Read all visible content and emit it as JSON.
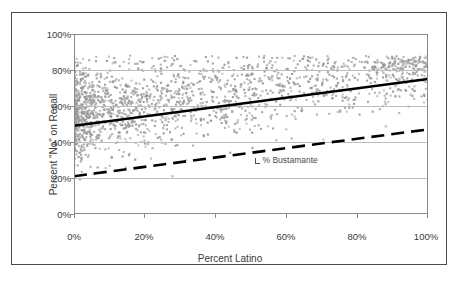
{
  "chart_data": {
    "type": "scatter",
    "title": "",
    "xlabel": "Percent Latino",
    "ylabel": "Percent \"No\" on Recall",
    "xlim": [
      0,
      100
    ],
    "ylim": [
      0,
      100
    ],
    "x_ticks": [
      "0%",
      "20%",
      "40%",
      "60%",
      "80%",
      "100%"
    ],
    "x_tick_values": [
      0,
      20,
      40,
      60,
      80,
      100
    ],
    "y_ticks": [
      "0%",
      "20%",
      "40%",
      "60%",
      "80%",
      "100%"
    ],
    "y_tick_values": [
      0,
      20,
      40,
      60,
      80,
      100
    ],
    "grid": "horizontal",
    "legend": "none",
    "point_color": "#9a9a9a",
    "line_color": "#000000",
    "annotations": [
      {
        "text": "% Bustamante",
        "x": 51,
        "y": 30,
        "marker": "leader-tick"
      }
    ],
    "series": [
      {
        "name": "Precincts",
        "type": "scatter",
        "marker": "diamond",
        "color": "#9a9a9a",
        "n": 1800,
        "description": "Precinct-level scatter of percent 'No' on recall versus percent Latino; dense cluster at low percent Latino with values mostly between 40% and 85%."
      },
      {
        "name": "No on Recall trend",
        "type": "line",
        "style": "solid",
        "color": "#000000",
        "x": [
          0,
          100
        ],
        "values": [
          49,
          75
        ]
      },
      {
        "name": "% Bustamante trend",
        "type": "line",
        "style": "dashed",
        "color": "#000000",
        "x": [
          0,
          100
        ],
        "values": [
          21,
          47
        ]
      }
    ]
  }
}
